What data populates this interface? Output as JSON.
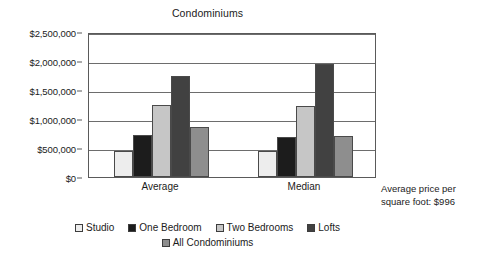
{
  "chart_data": {
    "type": "bar",
    "title": "Condominiums",
    "xlabel": "",
    "ylabel": "",
    "categories": [
      "Average",
      "Median"
    ],
    "series": [
      {
        "name": "Studio",
        "color": "#ededed",
        "values": [
          450000,
          445000
        ]
      },
      {
        "name": "One Bedroom",
        "color": "#1c1c1c",
        "values": [
          730000,
          690000
        ]
      },
      {
        "name": "Two Bedrooms",
        "color": "#c6c6c6",
        "values": [
          1250000,
          1230000
        ]
      },
      {
        "name": "Lofts",
        "color": "#414141",
        "values": [
          1750000,
          1950000
        ]
      },
      {
        "name": "All Condominiums",
        "color": "#8e8e8e",
        "values": [
          865000,
          710000
        ]
      }
    ],
    "ylim": [
      0,
      2500000
    ],
    "ytick_values": [
      2500000,
      2000000,
      1500000,
      1000000,
      500000,
      0
    ],
    "ytick_labels": [
      "$2,500,000",
      "$2,000,000",
      "$1,500,000",
      "$1,000,000",
      "$500,000",
      "$0"
    ],
    "grid": true,
    "legend_position": "bottom",
    "annotations": [
      {
        "text_line_1": "Average price per",
        "text_line_2": "square foot: $996"
      }
    ]
  },
  "annotation": {
    "line1": "Average price per",
    "line2": "square foot: $996"
  }
}
